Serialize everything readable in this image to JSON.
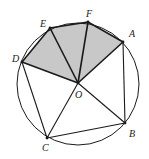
{
  "diagram": {
    "colors": {
      "stroke": "#1a1a1a",
      "shade": "#c8c8c8",
      "background": "#ffffff"
    },
    "circle": {
      "cx": 78,
      "cy": 84,
      "r": 61
    },
    "points": {
      "A": {
        "x": 123,
        "y": 42,
        "label": "A"
      },
      "B": {
        "x": 125,
        "y": 123,
        "label": "B"
      },
      "C": {
        "x": 47,
        "y": 138,
        "label": "C"
      },
      "D": {
        "x": 22,
        "y": 62,
        "label": "D"
      },
      "E": {
        "x": 50,
        "y": 28,
        "label": "E"
      },
      "F": {
        "x": 88,
        "y": 22,
        "label": "F"
      },
      "O": {
        "x": 78,
        "y": 83,
        "label": "O"
      }
    },
    "shaded_region": [
      "O",
      "D",
      "E",
      "F",
      "A"
    ],
    "segments": [
      [
        "D",
        "E"
      ],
      [
        "E",
        "F"
      ],
      [
        "F",
        "A"
      ],
      [
        "O",
        "D"
      ],
      [
        "O",
        "E"
      ],
      [
        "O",
        "F"
      ],
      [
        "O",
        "A"
      ],
      [
        "O",
        "B"
      ],
      [
        "O",
        "C"
      ],
      [
        "D",
        "C"
      ],
      [
        "C",
        "B"
      ],
      [
        "A",
        "B"
      ]
    ]
  }
}
